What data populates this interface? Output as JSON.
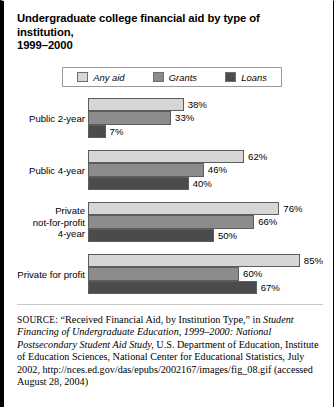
{
  "title": {
    "line1": "Undergraduate college financial aid by type of institution,",
    "line2": "1999–2000"
  },
  "legend": {
    "position": "top",
    "items": [
      {
        "label": "Any aid",
        "color": "#d6d6d6",
        "icon": "legend-swatch-any-aid"
      },
      {
        "label": "Grants",
        "color": "#8c8c8c",
        "icon": "legend-swatch-grants"
      },
      {
        "label": "Loans",
        "color": "#4b4b4b",
        "icon": "legend-swatch-loans"
      }
    ]
  },
  "chart_data": {
    "type": "bar",
    "orientation": "horizontal",
    "title": "Undergraduate college financial aid by type of institution, 1999–2000",
    "xlabel": "",
    "ylabel": "",
    "xlim": [
      0,
      85
    ],
    "grid": false,
    "legend_position": "top",
    "value_suffix": "%",
    "categories": [
      "Public 2-year",
      "Public 4-year",
      "Private not-for-profit 4-year",
      "Private for profit"
    ],
    "series": [
      {
        "name": "Any aid",
        "color": "#d6d6d6",
        "values": [
          38,
          62,
          76,
          85
        ]
      },
      {
        "name": "Grants",
        "color": "#8c8c8c",
        "values": [
          33,
          46,
          66,
          60
        ]
      },
      {
        "name": "Loans",
        "color": "#4b4b4b",
        "values": [
          7,
          40,
          50,
          67
        ]
      }
    ]
  },
  "groups": [
    {
      "label_lines": [
        "Public 2-year"
      ],
      "bars": [
        {
          "series": "Any aid",
          "value": 38,
          "value_label": "38%",
          "color": "#d6d6d6"
        },
        {
          "series": "Grants",
          "value": 33,
          "value_label": "33%",
          "color": "#8c8c8c"
        },
        {
          "series": "Loans",
          "value": 7,
          "value_label": "7%",
          "color": "#4b4b4b"
        }
      ]
    },
    {
      "label_lines": [
        "Public 4-year"
      ],
      "bars": [
        {
          "series": "Any aid",
          "value": 62,
          "value_label": "62%",
          "color": "#d6d6d6"
        },
        {
          "series": "Grants",
          "value": 46,
          "value_label": "46%",
          "color": "#8c8c8c"
        },
        {
          "series": "Loans",
          "value": 40,
          "value_label": "40%",
          "color": "#4b4b4b"
        }
      ]
    },
    {
      "label_lines": [
        "Private",
        "not-for-profit",
        "4-year"
      ],
      "bars": [
        {
          "series": "Any aid",
          "value": 76,
          "value_label": "76%",
          "color": "#d6d6d6"
        },
        {
          "series": "Grants",
          "value": 66,
          "value_label": "66%",
          "color": "#8c8c8c"
        },
        {
          "series": "Loans",
          "value": 50,
          "value_label": "50%",
          "color": "#4b4b4b"
        }
      ]
    },
    {
      "label_lines": [
        "Private for profit"
      ],
      "bars": [
        {
          "series": "Any aid",
          "value": 85,
          "value_label": "85%",
          "color": "#d6d6d6"
        },
        {
          "series": "Grants",
          "value": 60,
          "value_label": "60%",
          "color": "#8c8c8c"
        },
        {
          "series": "Loans",
          "value": 67,
          "value_label": "67%",
          "color": "#4b4b4b"
        }
      ]
    }
  ],
  "source": {
    "label": "SOURCE:",
    "segments": [
      {
        "text": " “Received Financial Aid, by Institution Type,” in ",
        "italic": false
      },
      {
        "text": "Student Financing of Undergraduate Education, 1999–2000: National Postsecondary Student Aid Study,",
        "italic": true
      },
      {
        "text": " U.S. Department of Education, Institute of Education Sciences, National Center for Educational Statistics, July 2002, http://nces.ed.gov/das/epubs/2002167/images/fig_08.gif (accessed August 28, 2004)",
        "italic": false
      }
    ]
  }
}
